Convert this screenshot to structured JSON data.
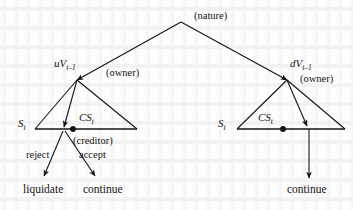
{
  "figure": {
    "type": "game-tree",
    "background_color": "#fdfdfd",
    "ink_color": "#141414"
  },
  "nodes": {
    "root": {
      "label": "(nature)",
      "player": "nature",
      "x": 181,
      "y": 22
    },
    "left_owner": {
      "state_label": "uV",
      "state_subscript": "t–1",
      "player_label": "(owner)",
      "x": 77,
      "y": 80
    },
    "right_owner": {
      "state_label": "dV",
      "state_subscript": "t–1",
      "player_label": "(owner)",
      "x": 287,
      "y": 80
    },
    "left_infoset": {
      "left_label": "S",
      "left_subscript": "t",
      "center_label": "CS",
      "center_subscript": "t",
      "player_label": "(creditor)",
      "x": 73,
      "y": 129
    },
    "right_infoset": {
      "left_label": "S",
      "left_subscript": "t",
      "center_label": "CS",
      "center_subscript": "t",
      "x": 283,
      "y": 129
    }
  },
  "actions": {
    "left_reject": "reject",
    "left_accept": "accept"
  },
  "outcomes": {
    "left_liquidate": "liquidate",
    "left_continue": "continue",
    "right_continue": "continue"
  }
}
